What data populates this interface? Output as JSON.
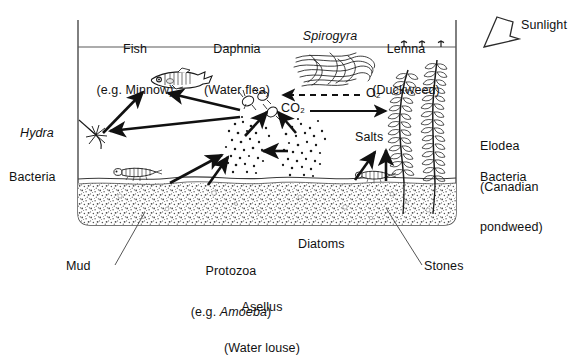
{
  "diagram": {
    "colors": {
      "ink": "#111111",
      "line": "#2b2b2b",
      "gravel": "#bdbdbd",
      "background": "#ffffff"
    },
    "top_labels": [
      {
        "name": "fish",
        "line1": "Fish",
        "line2": "(e.g. Minnow)",
        "italic1": false
      },
      {
        "name": "daphnia",
        "line1": "Daphnia",
        "line2": "(Water flea)",
        "italic1": true
      },
      {
        "name": "spirogyra",
        "line1": "Spirogyra",
        "line2": "",
        "italic1": true
      },
      {
        "name": "lemna",
        "line1": "Lemna",
        "line2": "(Duckweed)",
        "italic1": true
      }
    ],
    "sunlight": {
      "label": "Sunlight",
      "icon": "sunlight-arrow-icon"
    },
    "left_labels": [
      {
        "name": "hydra",
        "text": "Hydra",
        "italic": true
      },
      {
        "name": "bacteria-left",
        "text": "Bacteria",
        "italic": false
      }
    ],
    "right_labels": [
      {
        "name": "elodea",
        "line1": "Elodea",
        "line2": "(Canadian",
        "line3": "pondweed)",
        "italic1": true
      },
      {
        "name": "bacteria-right",
        "text": "Bacteria",
        "italic": false
      }
    ],
    "gas_labels": [
      {
        "name": "oxygen",
        "text": "O2",
        "display": "O₂",
        "arrow": "dashed-left"
      },
      {
        "name": "carbon-dioxide",
        "text": "CO2",
        "display": "CO₂",
        "arrow": "solid-right"
      }
    ],
    "inner_labels": [
      {
        "name": "salts",
        "text": "Salts"
      }
    ],
    "bottom_labels": [
      {
        "name": "mud",
        "text": "Mud",
        "leader": true
      },
      {
        "name": "protozoa",
        "line1": "Protozoa",
        "line2": "(e.g. Amoeba)",
        "italic_part": "Amoeba"
      },
      {
        "name": "diatoms",
        "text": "Diatoms"
      },
      {
        "name": "asellus",
        "line1": "Asellus",
        "line2": "(Water louse)",
        "italic1": true
      },
      {
        "name": "stones",
        "text": "Stones",
        "leader": true
      }
    ],
    "organisms": [
      {
        "name": "minnow-fish",
        "type": "fish"
      },
      {
        "name": "hydra-organism",
        "type": "hydra"
      },
      {
        "name": "daphnia-organisms",
        "type": "water-flea",
        "count": 3
      },
      {
        "name": "spirogyra-mass",
        "type": "filamentous-alga"
      },
      {
        "name": "lemna-duckweed",
        "type": "floating-plant",
        "count": 3
      },
      {
        "name": "elodea-plant-left",
        "type": "submerged-plant"
      },
      {
        "name": "elodea-plant-right",
        "type": "submerged-plant"
      },
      {
        "name": "asellus-left",
        "type": "water-louse"
      },
      {
        "name": "asellus-right",
        "type": "water-louse"
      },
      {
        "name": "protozoa-cluster",
        "type": "dot-cluster"
      },
      {
        "name": "diatom-cluster",
        "type": "dot-cluster"
      }
    ],
    "food_web_arrows": [
      {
        "name": "arrow-hydra-to-fish",
        "from": "hydra",
        "to": "fish"
      },
      {
        "name": "arrow-daphnia-to-fish",
        "from": "daphnia",
        "to": "fish"
      },
      {
        "name": "arrow-daphnia-to-hydra",
        "from": "daphnia",
        "to": "hydra"
      },
      {
        "name": "arrow-protozoa-to-daphnia",
        "from": "protozoa",
        "to": "daphnia"
      },
      {
        "name": "arrow-diatoms-to-daphnia",
        "from": "diatoms",
        "to": "daphnia"
      },
      {
        "name": "arrow-diatoms-to-protozoa",
        "from": "diatoms",
        "to": "protozoa"
      },
      {
        "name": "arrow-asellus-to-protozoa-1",
        "from": "asellus",
        "to": "protozoa"
      },
      {
        "name": "arrow-asellus-to-protozoa-2",
        "from": "bacteria",
        "to": "protozoa"
      },
      {
        "name": "arrow-mud-to-salts-diagonal",
        "from": "mud",
        "to": "salts"
      },
      {
        "name": "arrow-mud-to-salts-vertical",
        "from": "mud",
        "to": "salts"
      }
    ]
  }
}
